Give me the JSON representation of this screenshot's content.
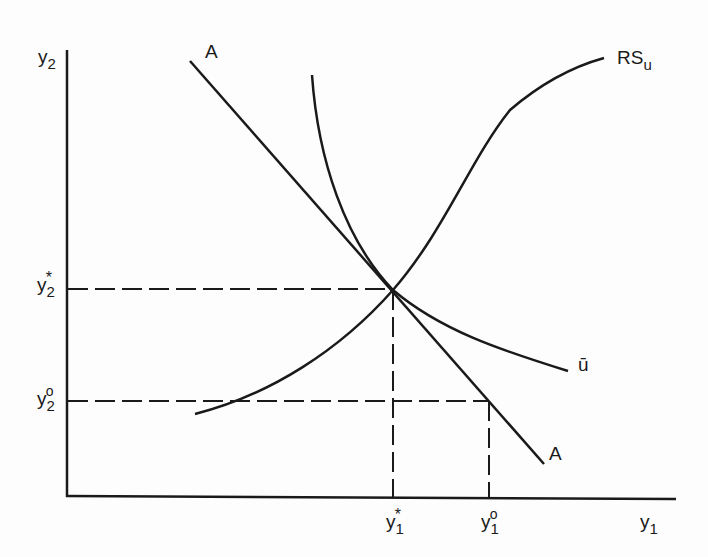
{
  "diagram": {
    "type": "economics-tangency-diagram",
    "axes": {
      "x_label": {
        "base": "y",
        "sub": "1"
      },
      "y_label": {
        "base": "y",
        "sub": "2"
      }
    },
    "curves": [
      {
        "id": "budget-line",
        "label": "A",
        "label_end": "A",
        "kind": "straight line, negative slope"
      },
      {
        "id": "indifference-curve",
        "label": "ū",
        "kind": "convex, downward sloping"
      },
      {
        "id": "rs-curve",
        "label_base": "RS",
        "label_sub": "u",
        "kind": "S-shaped, upward sloping"
      }
    ],
    "ticks": {
      "y2_star": {
        "base": "y",
        "sub": "2",
        "sup": "*"
      },
      "y2_zero": {
        "base": "y",
        "sub": "2",
        "sup": "o"
      },
      "y1_star": {
        "base": "y",
        "sub": "1",
        "sup": "*"
      },
      "y1_zero": {
        "base": "y",
        "sub": "1",
        "sup": "o"
      }
    },
    "points": {
      "equilibrium": "(y1*, y2*) — tangency of A and ū, intersected by RSu",
      "alternative": "(y1o, y2o) — on line A"
    },
    "colors": {
      "ink": "#1a1a1a",
      "background": "#fdfdfd"
    }
  }
}
